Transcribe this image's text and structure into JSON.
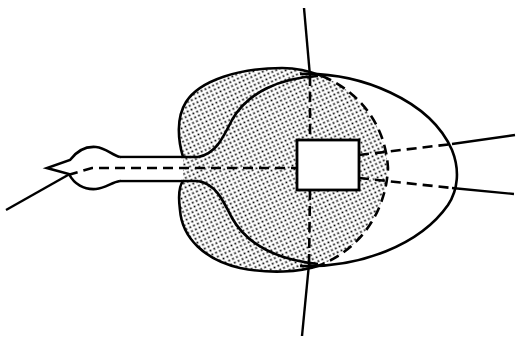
{
  "diagram": {
    "title": "",
    "type": "line-art schematic",
    "colors": {
      "background": "#ffffff",
      "stroke": "#000000",
      "stipple_dot": "#000000"
    },
    "elements": [
      {
        "id": "vertical-axis",
        "kind": "solid-line"
      },
      {
        "id": "left-diagonal",
        "kind": "solid-line"
      },
      {
        "id": "neck-head-outline",
        "kind": "solid-outline"
      },
      {
        "id": "stippled-region",
        "kind": "stippled-fill"
      },
      {
        "id": "large-ellipse",
        "kind": "solid-outline"
      },
      {
        "id": "inner-dashed-arc",
        "kind": "dashed-line"
      },
      {
        "id": "central-rectangle",
        "kind": "white-box"
      },
      {
        "id": "horizontal-dashed-axis",
        "kind": "dashed-line"
      },
      {
        "id": "vertical-dashed-axis",
        "kind": "dashed-line"
      },
      {
        "id": "right-upper-ray",
        "kind": "dashed-then-solid-line"
      },
      {
        "id": "right-lower-ray",
        "kind": "dashed-then-solid-line"
      }
    ],
    "labels": []
  }
}
